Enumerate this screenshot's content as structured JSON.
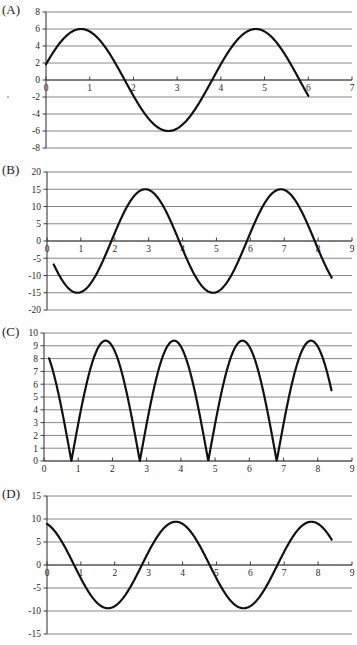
{
  "document": {
    "kind": "figure-sheet",
    "panel_count": 4
  },
  "panels": [
    {
      "label": "(A)",
      "name": "panel-a"
    },
    {
      "label": "(B)",
      "name": "panel-b"
    },
    {
      "label": "(C)",
      "name": "panel-c"
    },
    {
      "label": "(D)",
      "name": "panel-d"
    }
  ],
  "chart_data": [
    {
      "id": "A",
      "type": "line",
      "title": "",
      "xlabel": "",
      "ylabel": "",
      "xlim": [
        0,
        7
      ],
      "ylim": [
        -8,
        8
      ],
      "xticks": [
        0,
        1,
        2,
        3,
        4,
        5,
        6,
        7
      ],
      "yticks": [
        -8,
        -6,
        -4,
        -2,
        0,
        2,
        4,
        6,
        8
      ],
      "xticklabels": [
        "0",
        "1",
        "2",
        "3",
        "4",
        "5",
        "6",
        "7"
      ],
      "yticklabels": [
        "-8",
        "-6",
        "-4",
        "-2",
        "0",
        "2",
        "4",
        "6",
        "8"
      ],
      "grid": "horizontal",
      "legend": "none",
      "curve": {
        "form": "sine",
        "amplitude": 6,
        "period": 4,
        "phase_peak_x": 0.8,
        "phase_min_x": 2.8,
        "vertical_offset": 0,
        "x_start": 0.0,
        "x_end": 6.0,
        "y_at_x_start": 2.1,
        "y_at_x_end": -2.4
      },
      "annotations": []
    },
    {
      "id": "B",
      "type": "line",
      "title": "",
      "xlabel": "",
      "ylabel": "",
      "xlim": [
        0,
        9
      ],
      "ylim": [
        -20,
        20
      ],
      "xticks": [
        0,
        1,
        2,
        3,
        4,
        5,
        6,
        7,
        8,
        9
      ],
      "yticks": [
        -20,
        -15,
        -10,
        -5,
        0,
        5,
        10,
        15,
        20
      ],
      "xticklabels": [
        "0",
        "1",
        "2",
        "3",
        "4",
        "5",
        "6",
        "7",
        "8",
        "9"
      ],
      "yticklabels": [
        "-20",
        "-15",
        "-10",
        "-5",
        "0",
        "5",
        "10",
        "15",
        "20"
      ],
      "grid": "horizontal",
      "legend": "none",
      "curve": {
        "form": "sine",
        "amplitude": 15,
        "period": 4,
        "phase_min_x": 0.9,
        "phase_peak_x": 2.9,
        "vertical_offset": 0,
        "x_start": 0.2,
        "x_end": 8.4,
        "y_at_x_start": -8.0,
        "y_at_x_end": -11.7
      },
      "annotations": []
    },
    {
      "id": "C",
      "type": "line",
      "title": "",
      "xlabel": "",
      "ylabel": "",
      "xlim": [
        0,
        9
      ],
      "ylim": [
        0,
        10
      ],
      "xticks": [
        0,
        1,
        2,
        3,
        4,
        5,
        6,
        7,
        8,
        9
      ],
      "yticks": [
        0,
        1,
        2,
        3,
        4,
        5,
        6,
        7,
        8,
        9,
        10
      ],
      "xticklabels": [
        "0",
        "1",
        "2",
        "3",
        "4",
        "5",
        "6",
        "7",
        "8",
        "9"
      ],
      "yticklabels": [
        "0",
        "1",
        "2",
        "3",
        "4",
        "5",
        "6",
        "7",
        "8",
        "9",
        "10"
      ],
      "grid": "horizontal",
      "legend": "none",
      "curve": {
        "form": "rectified-sine",
        "amplitude": 9.4,
        "period": 2,
        "zero_crossings": [
          0.8,
          2.8,
          4.8,
          6.8
        ],
        "peaks_x": [
          1.8,
          3.8,
          5.8,
          7.8
        ],
        "peak_value": 9.4,
        "x_start": 0.15,
        "x_end": 8.4,
        "y_at_x_start": 8.4,
        "y_at_x_end": 5.4
      },
      "annotations": []
    },
    {
      "id": "D",
      "type": "line",
      "title": "",
      "xlabel": "",
      "ylabel": "",
      "xlim": [
        0,
        9
      ],
      "ylim": [
        -15,
        15
      ],
      "xticks": [
        0,
        1,
        2,
        3,
        4,
        5,
        6,
        7,
        8,
        9
      ],
      "yticks": [
        -15,
        -10,
        -5,
        0,
        5,
        10,
        15
      ],
      "xticklabels": [
        "0",
        "1",
        "2",
        "3",
        "4",
        "5",
        "6",
        "7",
        "8",
        "9"
      ],
      "yticklabels": [
        "-15",
        "-10",
        "-5",
        "0",
        "5",
        "10",
        "15"
      ],
      "grid": "horizontal",
      "legend": "none",
      "curve": {
        "form": "sine",
        "amplitude": 9.4,
        "period": 4,
        "phase_min_x": 1.8,
        "phase_peak_x": 3.8,
        "vertical_offset": 0,
        "x_start": 0.0,
        "x_end": 8.4,
        "y_at_x_start": 8.7,
        "y_at_x_end": 5.2
      },
      "annotations": []
    }
  ],
  "colors": {
    "curve": "#111111",
    "gridline": "#7a7a7a",
    "axis": "#3b3b3b",
    "text": "#1f1f1f",
    "background": "#ffffff"
  }
}
